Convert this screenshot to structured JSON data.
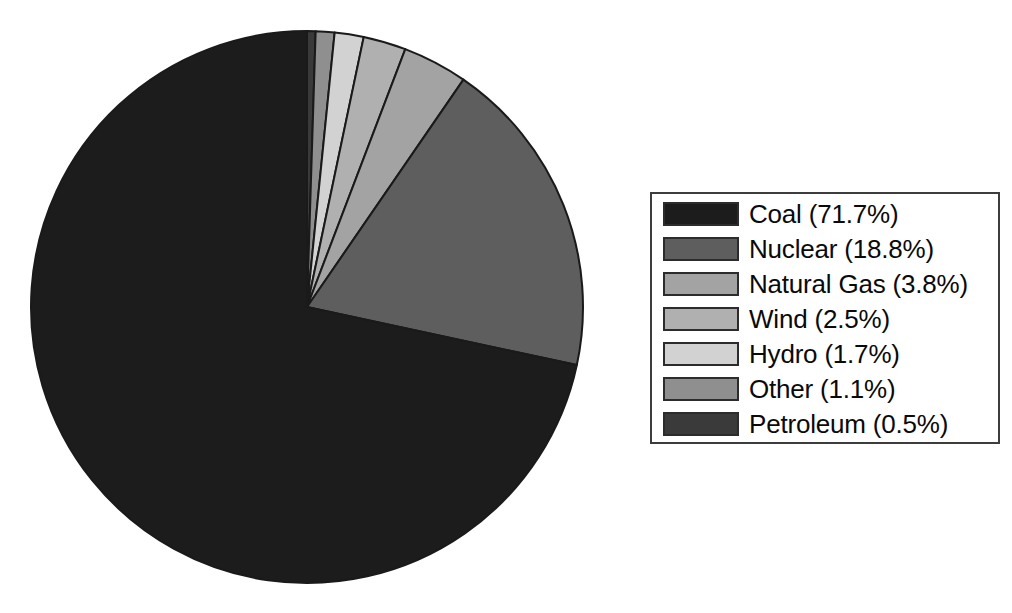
{
  "chart_data": {
    "type": "pie",
    "title": "",
    "subtitle": "",
    "xlabel": "",
    "ylabel": "",
    "legend_position": "right",
    "grid": false,
    "start_angle_deg": 90,
    "direction": "clockwise",
    "units": "percent",
    "categories": [
      "Coal",
      "Nuclear",
      "Natural Gas",
      "Wind",
      "Hydro",
      "Other",
      "Petroleum"
    ],
    "values": [
      71.7,
      18.8,
      3.8,
      2.5,
      1.7,
      1.1,
      0.5
    ],
    "colors": [
      "#1c1c1c",
      "#5e5e5e",
      "#a3a3a3",
      "#b0b0b0",
      "#d2d2d2",
      "#8f8f8f",
      "#3a3a3a"
    ],
    "slices": [
      {
        "label": "Coal",
        "value": 71.7,
        "display": "Coal (71.7%)",
        "color": "#1c1c1c"
      },
      {
        "label": "Nuclear",
        "value": 18.8,
        "display": "Nuclear (18.8%)",
        "color": "#5e5e5e"
      },
      {
        "label": "Natural Gas",
        "value": 3.8,
        "display": "Natural Gas (3.8%)",
        "color": "#a3a3a3"
      },
      {
        "label": "Wind",
        "value": 2.5,
        "display": "Wind (2.5%)",
        "color": "#b0b0b0"
      },
      {
        "label": "Hydro",
        "value": 1.7,
        "display": "Hydro (1.7%)",
        "color": "#d2d2d2"
      },
      {
        "label": "Other",
        "value": 1.1,
        "display": "Other (1.1%)",
        "color": "#8f8f8f"
      },
      {
        "label": "Petroleum",
        "value": 0.5,
        "display": "Petroleum (0.5%)",
        "color": "#3a3a3a"
      }
    ],
    "draw_order_clockwise_from_top": [
      "Petroleum",
      "Other",
      "Hydro",
      "Wind",
      "Natural Gas",
      "Nuclear",
      "Coal"
    ],
    "slice_edge_color": "#1a1a1a"
  },
  "legend": {
    "border_color": "#3d3d3d",
    "entries": [
      {
        "label": "Coal (71.7%)",
        "color": "#1c1c1c"
      },
      {
        "label": "Nuclear (18.8%)",
        "color": "#5e5e5e"
      },
      {
        "label": "Natural Gas (3.8%)",
        "color": "#a3a3a3"
      },
      {
        "label": "Wind (2.5%)",
        "color": "#b0b0b0"
      },
      {
        "label": "Hydro (1.7%)",
        "color": "#d2d2d2"
      },
      {
        "label": "Other (1.1%)",
        "color": "#8f8f8f"
      },
      {
        "label": "Petroleum (0.5%)",
        "color": "#3a3a3a"
      }
    ]
  }
}
